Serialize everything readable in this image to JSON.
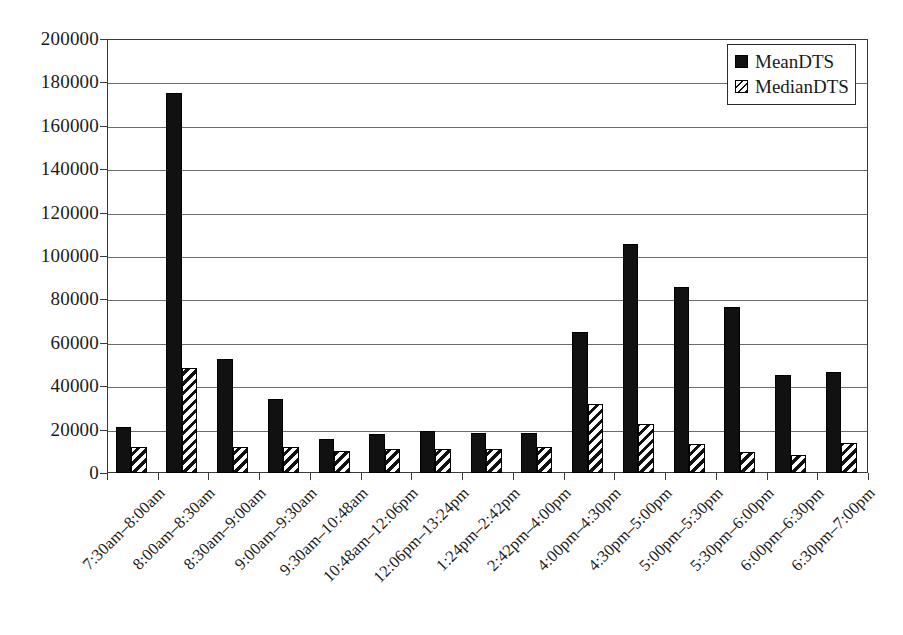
{
  "chart_data": {
    "type": "bar",
    "title": "",
    "xlabel": "",
    "ylabel": "",
    "ylim": [
      0,
      200000
    ],
    "ytick_step": 20000,
    "yticks": [
      "0",
      "20000",
      "40000",
      "60000",
      "80000",
      "100000",
      "120000",
      "140000",
      "160000",
      "180000",
      "200000"
    ],
    "grid": true,
    "legend_position": "top-right",
    "categories": [
      "7:30am–8:00am",
      "8:00am–8:30am",
      "8:30am–9:00am",
      "9:00am–9:30am",
      "9:30am–10:48am",
      "10:48am–12:06pm",
      "12:06pm–13:24pm",
      "1:24pm–2:42pm",
      "2:42pm–4:00pm",
      "4:00pm–4:30pm",
      "4:30pm–5:00pm",
      "5:00pm–5:30pm",
      "5:30pm–6:00pm",
      "6:00pm–6:30pm",
      "6:30pm–7:00pm"
    ],
    "series": [
      {
        "name": "MeanDTS",
        "style": "solid-black",
        "values": [
          21000,
          175000,
          52500,
          34000,
          15500,
          18000,
          19500,
          18500,
          18500,
          65000,
          105500,
          85500,
          76500,
          45000,
          46500
        ]
      },
      {
        "name": "MedianDTS",
        "style": "diagonal-hatch",
        "values": [
          12000,
          48500,
          12000,
          12000,
          10000,
          11000,
          11000,
          11000,
          12000,
          32000,
          22500,
          13500,
          9500,
          8500,
          14000
        ]
      }
    ]
  },
  "legend": {
    "items": [
      {
        "label": "MeanDTS"
      },
      {
        "label": "MedianDTS"
      }
    ]
  },
  "colors": {
    "mean": "#111111",
    "median_hatch": "#111111",
    "axis": "#3a3a3a",
    "grid": "#6b6b6b",
    "background": "#ffffff"
  }
}
